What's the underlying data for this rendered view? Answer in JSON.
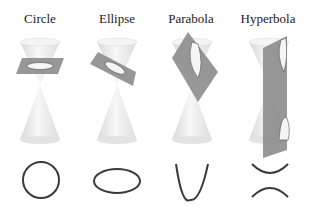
{
  "sections": [
    {
      "id": "circle",
      "label": "Circle",
      "center_x": 40,
      "curve": "circle"
    },
    {
      "id": "ellipse",
      "label": "Ellipse",
      "center_x": 117,
      "curve": "ellipse"
    },
    {
      "id": "parabola",
      "label": "Parabola",
      "center_x": 191,
      "curve": "parabola"
    },
    {
      "id": "hyperbola",
      "label": "Hyperbola",
      "center_x": 268,
      "curve": "hyperbola"
    }
  ],
  "colors": {
    "plane": "#8c8c8c",
    "cone": "#e6e6e6",
    "curve": "#3a3a3a",
    "text": "#1a1a1a"
  }
}
